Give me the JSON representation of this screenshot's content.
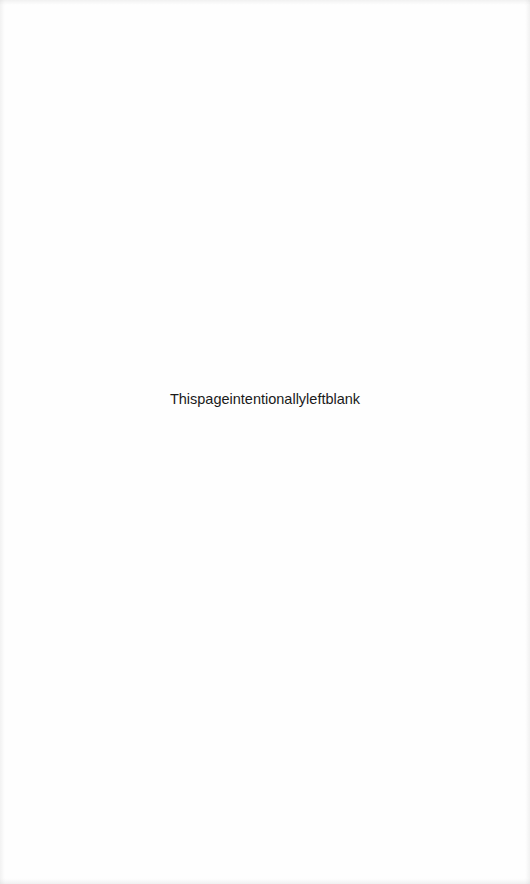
{
  "page": {
    "notice_text": "Thispageintentionallyleftblank",
    "background_color": "#fefefe",
    "text_color": "#1a1a1a"
  }
}
